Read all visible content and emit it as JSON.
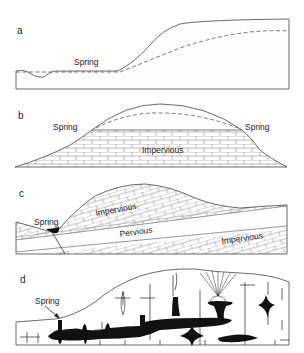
{
  "figure": {
    "panels": [
      {
        "id": "a",
        "letter": "a",
        "labels": {
          "spring": "Spring"
        },
        "description": "Spring where water table (dashed) intersects ground surface in permeable dotted sediment"
      },
      {
        "id": "b",
        "letter": "b",
        "labels": {
          "spring_left": "Spring",
          "spring_right": "Spring",
          "layer": "Impervious"
        },
        "description": "Perched water table above impervious brick layer with springs at both contacts"
      },
      {
        "id": "c",
        "letter": "c",
        "labels": {
          "spring": "Spring",
          "upper": "Impervious",
          "middle": "Pervious",
          "lower": "Impervious"
        },
        "description": "Inclined pervious layer between impervious beds with spring at fault"
      },
      {
        "id": "d",
        "letter": "d",
        "labels": {
          "spring": "Spring"
        },
        "description": "Karst limestone with solution cavities (black) and spring"
      }
    ],
    "colors": {
      "line": "#444444",
      "cave": "#111111",
      "background": "#ffffff",
      "stipple": "#bbbbbb"
    }
  }
}
